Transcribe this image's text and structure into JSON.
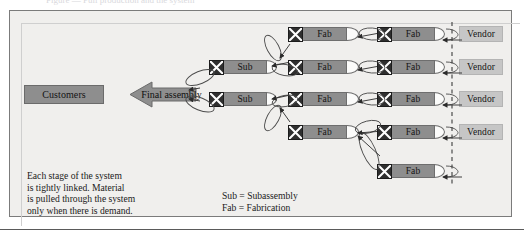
{
  "figure": {
    "caption_remnant": "Figure — Pull production and the system",
    "background_color": "#f0efed",
    "stage_color": "#8e8e8e",
    "vendor_color": "#c6c6c6",
    "kanban_color": "#2f2f2f",
    "buffer_color": "#fbfbfa"
  },
  "customers": {
    "label": "Customers"
  },
  "final_assembly": {
    "label": "Final assembly"
  },
  "labels": {
    "sub": "Sub",
    "fab": "Fab",
    "vendor": "Vendor"
  },
  "columns": {
    "sub_column": [
      {
        "label": "Sub",
        "row": 2
      },
      {
        "label": "Sub",
        "row": 3
      }
    ],
    "fab_column_1": [
      {
        "label": "Fab",
        "row": 1
      },
      {
        "label": "Fab",
        "row": 2
      },
      {
        "label": "Fab",
        "row": 3
      },
      {
        "label": "Fab",
        "row": 4
      }
    ],
    "fab_column_2": [
      {
        "label": "Fab",
        "row": 1
      },
      {
        "label": "Fab",
        "row": 2
      },
      {
        "label": "Fab",
        "row": 3
      },
      {
        "label": "Fab",
        "row": 4
      },
      {
        "label": "Fab",
        "row": 5
      }
    ],
    "vendor_column": [
      {
        "label": "Vendor",
        "row": 1
      },
      {
        "label": "Vendor",
        "row": 2
      },
      {
        "label": "Vendor",
        "row": 3
      },
      {
        "label": "Vendor",
        "row": 4
      }
    ]
  },
  "note": {
    "text": "Each stage of the system\nis tightly linked. Material\nis pulled through the system\nonly when there is demand."
  },
  "legend": {
    "text": "Sub = Subassembly\nFab = Fabrication"
  },
  "divider": {
    "style": "dashed",
    "meaning": "vendor boundary"
  }
}
